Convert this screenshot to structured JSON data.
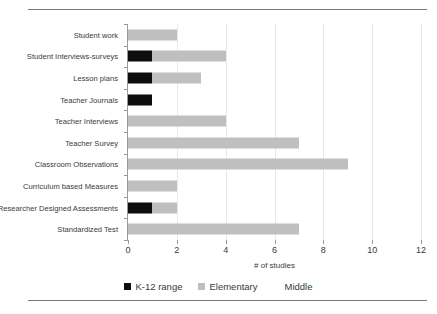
{
  "chart_data": {
    "type": "bar",
    "orientation": "horizontal",
    "stacked": true,
    "title": "",
    "xlabel": "# of studies",
    "ylabel": "",
    "xlim": [
      0,
      12
    ],
    "xticks": [
      0,
      2,
      4,
      6,
      8,
      10,
      12
    ],
    "xtick_labels": [
      "0",
      "2",
      "4",
      "6",
      "8",
      "10",
      "12"
    ],
    "grid": "vertical",
    "legend_position": "bottom",
    "categories": [
      "Student work",
      "Student Interviews-surveys",
      "Lesson plans",
      "Teacher Journals",
      "Teacher Interviews",
      "Teacher Survey",
      "Classroom Observations",
      "Curriculum based Measures",
      "Researcher Designed Assessments",
      "Standardized Test"
    ],
    "series": [
      {
        "name": "K-12 range",
        "color": "#0d0d0d",
        "values": [
          0,
          1,
          1,
          1,
          0,
          0,
          0,
          0,
          1,
          0
        ]
      },
      {
        "name": "Elementary",
        "color": "#bfbfbf",
        "values": [
          2,
          3,
          2,
          0,
          4,
          7,
          9,
          2,
          1,
          7
        ]
      },
      {
        "name": "Middle",
        "color": "#ffffff",
        "values": [
          0,
          0,
          0,
          0,
          0,
          0,
          0,
          0,
          0,
          0
        ]
      }
    ],
    "totals": [
      2,
      4,
      3,
      1,
      4,
      7,
      9,
      2,
      2,
      7
    ]
  },
  "legend": {
    "items": [
      {
        "label": "K-12 range",
        "swatch": "k12"
      },
      {
        "label": "Elementary",
        "swatch": "elem"
      },
      {
        "label": "Middle",
        "swatch": "mid"
      }
    ]
  }
}
